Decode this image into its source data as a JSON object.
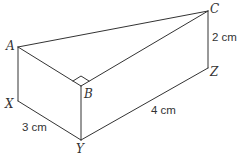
{
  "diagram": {
    "type": "triangular-prism",
    "vertices": {
      "A": "A",
      "B": "B",
      "C": "C",
      "X": "X",
      "Y": "Y",
      "Z": "Z"
    },
    "measurements": {
      "XY": "3 cm",
      "YZ": "4 cm",
      "CZ": "2 cm"
    },
    "right_angle_at": "B",
    "edges": [
      "AB",
      "BC",
      "AC",
      "AX",
      "BY",
      "CZ",
      "XY",
      "YZ"
    ],
    "line_color": "#333333"
  }
}
